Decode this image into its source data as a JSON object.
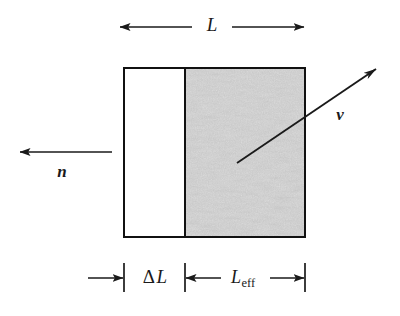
{
  "figure": {
    "type": "physics-schematic",
    "background_color": "#ffffff",
    "ink_color": "#1a1a1a",
    "shaded_region_color": "#c8c8c8"
  },
  "labels": {
    "total_length": "L",
    "delta_length_delta": "Δ",
    "delta_length_L": "L",
    "effective_length_base": "L",
    "effective_length_sub": "eff",
    "normal_vector": "n",
    "velocity_vector": "v"
  },
  "geometry": {
    "box": {
      "x": 124,
      "y": 68,
      "width": 181,
      "height": 169
    },
    "divider_x": 185,
    "top_dimension_y": 27,
    "bottom_dimension_y": 278,
    "tick_left_x": 124,
    "tick_mid_x": 185,
    "tick_right_x": 305,
    "normal_arrow_y": 152,
    "velocity_start": {
      "x": 237,
      "y": 163
    },
    "velocity_end": {
      "x": 378,
      "y": 68
    }
  }
}
